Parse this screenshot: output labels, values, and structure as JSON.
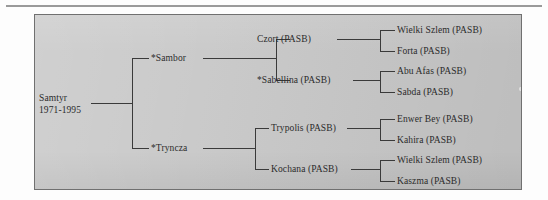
{
  "figure": {
    "type": "pedigree-tree",
    "orientation": "left-to-right",
    "generations": 4,
    "panel_color": "#c9c9c9",
    "line_color": "#3a3a3a",
    "text_color": "#2b2b2b"
  },
  "tree": {
    "root": {
      "name": "Samtyr",
      "years": "1971-1995"
    },
    "generation2": [
      {
        "label": "*Sambor"
      },
      {
        "label": "*Tryncza"
      }
    ],
    "generation3": [
      {
        "label": "Czort (PASB)"
      },
      {
        "label": "*Sabellina (PASB)"
      },
      {
        "label": "Trypolis (PASB)"
      },
      {
        "label": "Kochana (PASB)"
      }
    ],
    "generation4": [
      {
        "label": "Wielki Szlem (PASB)"
      },
      {
        "label": "Forta (PASB)"
      },
      {
        "label": "Abu Afas (PASB)"
      },
      {
        "label": "Sabda (PASB)"
      },
      {
        "label": "Enwer Bey (PASB)"
      },
      {
        "label": "Kahira (PASB)"
      },
      {
        "label": "Wielki Szlem (PASB)"
      },
      {
        "label": "Kaszma (PASB)"
      }
    ]
  }
}
